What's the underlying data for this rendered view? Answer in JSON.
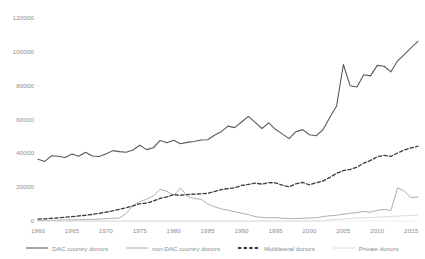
{
  "chart_data": {
    "type": "line",
    "title": "",
    "subtitle": "",
    "xlabel": "",
    "ylabel": "",
    "grid": false,
    "legend_position": "bottom",
    "xlim": [
      1960,
      2016
    ],
    "ylim": [
      0,
      120000
    ],
    "x_ticks": [
      "1960",
      "1965",
      "1970",
      "1975",
      "1980",
      "1985",
      "1990",
      "1995",
      "2000",
      "2005",
      "2010",
      "2015"
    ],
    "y_ticks": [
      "0",
      "20000",
      "40000",
      "60000",
      "80000",
      "100000",
      "120000"
    ],
    "x": [
      1960,
      1961,
      1962,
      1963,
      1964,
      1965,
      1966,
      1967,
      1968,
      1969,
      1970,
      1971,
      1972,
      1973,
      1974,
      1975,
      1976,
      1977,
      1978,
      1979,
      1980,
      1981,
      1982,
      1983,
      1984,
      1985,
      1986,
      1987,
      1988,
      1989,
      1990,
      1991,
      1992,
      1993,
      1994,
      1995,
      1996,
      1997,
      1998,
      1999,
      2000,
      2001,
      2002,
      2003,
      2004,
      2005,
      2006,
      2007,
      2008,
      2009,
      2010,
      2011,
      2012,
      2013,
      2014,
      2015,
      2016
    ],
    "series": [
      {
        "name": "DAC country donors",
        "color": "#595959",
        "style": "solid",
        "width": 1.1,
        "values": [
          36500,
          35200,
          38600,
          38300,
          37500,
          39600,
          38300,
          40600,
          38400,
          38100,
          39600,
          41600,
          41000,
          40600,
          42000,
          44800,
          42200,
          43300,
          47600,
          46200,
          47700,
          45700,
          46500,
          47000,
          47900,
          48000,
          50700,
          52800,
          56100,
          55200,
          58500,
          61800,
          58300,
          54700,
          58000,
          54200,
          51500,
          48700,
          52800,
          54000,
          51000,
          50400,
          54000,
          61200,
          68000,
          92500,
          80000,
          79200,
          86500,
          85800,
          92000,
          91500,
          88200,
          94700,
          98500,
          102500,
          106200
        ]
      },
      {
        "name": "non-DAC country donors",
        "color": "#9b9b9b",
        "style": "solid",
        "width": 0.8,
        "values": [
          350,
          400,
          450,
          520,
          600,
          700,
          820,
          900,
          980,
          1100,
          1400,
          1600,
          1800,
          4500,
          9200,
          11500,
          12800,
          14800,
          18800,
          17500,
          15200,
          19500,
          14800,
          13200,
          12900,
          10200,
          8400,
          7200,
          6400,
          5400,
          4600,
          3800,
          2600,
          2100,
          1900,
          2000,
          1600,
          1500,
          1400,
          1600,
          1800,
          1900,
          2600,
          3100,
          3400,
          4000,
          4600,
          5000,
          5600,
          5200,
          6300,
          6800,
          6200,
          19600,
          17500,
          13800,
          14200
        ]
      },
      {
        "name": "Multilateral donors",
        "color": "#3a3a3a",
        "style": "dashed",
        "width": 1.3,
        "values": [
          1100,
          1300,
          1600,
          1900,
          2200,
          2600,
          3000,
          3400,
          3900,
          4500,
          5200,
          6000,
          6900,
          7900,
          9000,
          10200,
          10600,
          11800,
          13400,
          14200,
          15600,
          15200,
          15600,
          15900,
          16000,
          16400,
          17400,
          18600,
          19200,
          19600,
          21000,
          21600,
          22400,
          21800,
          22700,
          22500,
          21200,
          20200,
          22000,
          22800,
          21400,
          22600,
          23600,
          25800,
          28200,
          29800,
          30500,
          31800,
          34200,
          35800,
          38000,
          38800,
          38200,
          40200,
          42000,
          43200,
          44200
        ]
      },
      {
        "name": "Private donors",
        "color": "#d6d6d6",
        "style": "solid",
        "width": 0.9,
        "values": [
          0,
          0,
          0,
          0,
          0,
          0,
          0,
          0,
          0,
          0,
          0,
          0,
          0,
          0,
          0,
          0,
          0,
          0,
          0,
          0,
          0,
          0,
          0,
          0,
          0,
          0,
          0,
          0,
          0,
          0,
          0,
          0,
          0,
          0,
          0,
          0,
          0,
          0,
          0,
          0,
          0,
          0,
          0,
          600,
          900,
          1200,
          1500,
          1700,
          1900,
          2000,
          2300,
          2500,
          2700,
          2900,
          3100,
          3300,
          3500
        ]
      }
    ]
  },
  "legend": {
    "items": [
      {
        "label": "DAC country donors"
      },
      {
        "label": "non-DAC country donors"
      },
      {
        "label": "Multilateral donors"
      },
      {
        "label": "Private donors"
      }
    ]
  }
}
